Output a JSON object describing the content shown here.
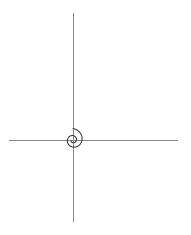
{
  "figure": {
    "background_color": "#ffffff",
    "width": 191,
    "height": 235
  },
  "axes": {
    "origin": {
      "x": 73,
      "y": 140
    },
    "color": "#888888",
    "stroke_width": 1,
    "x_axis": {
      "label": "x-axis",
      "x_start": 9,
      "x_end": 178,
      "y": 140
    },
    "y_axis": {
      "label": "y-axis",
      "y_start": 13,
      "y_end": 222,
      "x": 73
    },
    "ticks": [],
    "tick_labels": [],
    "grid": false
  },
  "chart_data": {
    "type": "line",
    "title": "",
    "subtitle": "",
    "xlabel": "",
    "ylabel": "",
    "curve_name": "logarithmic-spiral",
    "equation": "r = a * exp(b * theta)",
    "parameters": {
      "a": 9.0,
      "b": 0.1515,
      "growth_per_quarter_turn": 1.27,
      "theta_start_deg": -520,
      "theta_end_deg": 90,
      "theta_units": "degrees",
      "orientation": "counter-clockwise",
      "center_x": 73,
      "center_y": 140
    },
    "radii_at_angles": [
      {
        "theta_deg": 90,
        "r_px": 114,
        "point_px": {
          "x": 73,
          "y": 26
        },
        "note": "outer end on positive y-axis"
      },
      {
        "theta_deg": 0,
        "r_px": 90,
        "point_px": {
          "x": 163,
          "y": 140
        },
        "note": "crosses positive x-axis"
      },
      {
        "theta_deg": -90,
        "r_px": 72,
        "point_px": {
          "x": 73,
          "y": 212
        },
        "note": "lowest point on negative y-axis"
      },
      {
        "theta_deg": -180,
        "r_px": 51,
        "point_px": {
          "x": 22,
          "y": 140
        },
        "note": "crosses negative x-axis"
      },
      {
        "theta_deg": -270,
        "r_px": 28,
        "point_px": {
          "x": 73,
          "y": 112
        },
        "note": "inner loop top"
      },
      {
        "theta_deg": -360,
        "r_px": 11,
        "point_px": {
          "x": 84,
          "y": 140
        },
        "note": "inner loop right bulge"
      },
      {
        "theta_deg": -450,
        "r_px": 5,
        "point_px": {
          "x": 73,
          "y": 145
        },
        "note": "inner turn near origin"
      }
    ],
    "extents_px": {
      "left": 22,
      "right": 165,
      "top": 26,
      "bottom": 213
    },
    "stroke_color": "#3a3a3a",
    "stroke_width": 1.05,
    "fill": "none",
    "legend": [],
    "annotations": []
  }
}
